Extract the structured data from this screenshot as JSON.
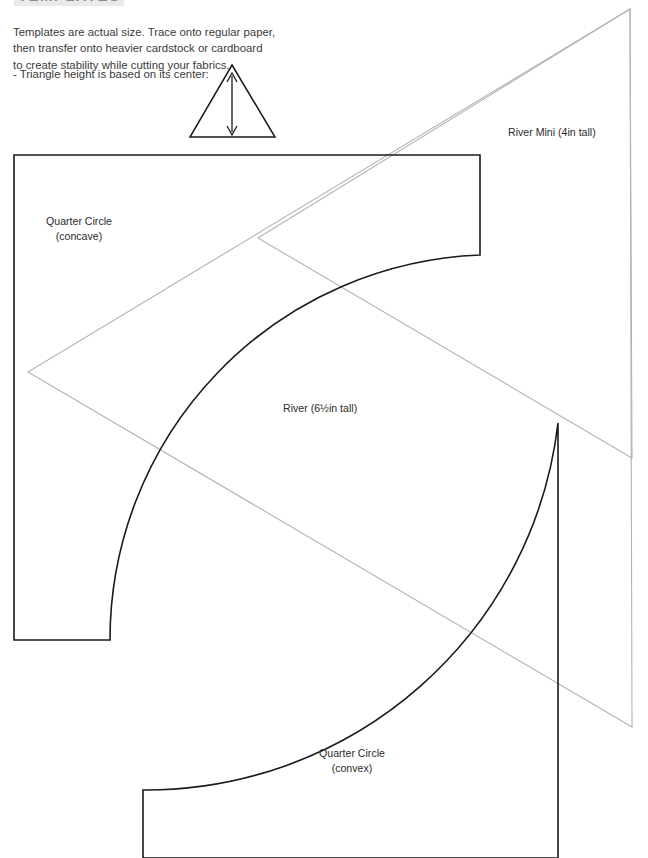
{
  "heading": {
    "text": "TEMPLATES"
  },
  "intro": {
    "line1": "Templates are actual size. Trace onto regular paper,",
    "line2": "then transfer onto heavier cardstock or cardboard",
    "line3": "to create stability while cutting your fabrics.",
    "note": "- Triangle height is based on its center:"
  },
  "labels": {
    "quarter_circle_concave_line1": "Quarter Circle",
    "quarter_circle_concave_line2": "(concave)",
    "river_mini": "River Mini (4in tall)",
    "river": "River (6½in tall)",
    "quarter_circle_convex_line1": "Quarter Circle",
    "quarter_circle_convex_line2": "(convex)"
  },
  "colors": {
    "template_stroke": "#1a1a1a",
    "guide_stroke": "#b3b3b3",
    "heading_highlight": "#e9e9e9",
    "text": "#2b2b2b",
    "page_background": "#ffffff"
  },
  "geometry": {
    "diagram_arrow_triangle": {
      "apex": [
        232,
        65
      ],
      "bottom_left": [
        190,
        137
      ],
      "bottom_right": [
        275,
        137
      ],
      "arrow_top": [
        232,
        74
      ],
      "arrow_bottom": [
        232,
        134
      ]
    },
    "quarter_circle_concave": {
      "top_left": [
        14,
        155
      ],
      "top_right": [
        480,
        155
      ],
      "right_edge_bottom": [
        480,
        255
      ],
      "arc_end": [
        110,
        640
      ],
      "bottom_left_x": 14,
      "bottom_y": 640,
      "arc_radius": 385
    },
    "quarter_circle_convex": {
      "top_right": [
        558,
        423
      ],
      "bottom_right": [
        558,
        857
      ],
      "bottom_left": [
        143,
        857
      ],
      "left_edge_top": [
        143,
        790
      ],
      "arc_radius": 415
    },
    "river_triangle": {
      "apex_top": [
        630,
        9
      ],
      "left_vertex": [
        28,
        372
      ],
      "bottom_vertex": [
        632,
        727
      ]
    },
    "river_mini_triangle": {
      "apex_top": [
        630,
        9
      ],
      "left_vertex": [
        258,
        238
      ],
      "bottom_vertex": [
        632,
        458
      ]
    }
  }
}
